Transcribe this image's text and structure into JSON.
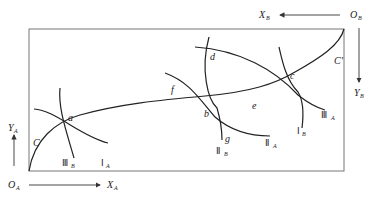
{
  "diagram": {
    "origins": {
      "A": "O_A",
      "B": "O_B"
    },
    "axes": {
      "XA": "X_A",
      "YA": "Y_A",
      "XB": "X_B",
      "YB": "Y_B"
    },
    "labels": {
      "O": "O",
      "A": "A",
      "B": "B",
      "X": "X",
      "Y": "Y",
      "C": "C",
      "Cprime": "C'",
      "a": "a",
      "b": "b",
      "c": "c",
      "d": "d",
      "e": "e",
      "f": "f",
      "g": "g"
    },
    "curves": {
      "IA": {
        "roman": "Ⅰ",
        "sub": "A"
      },
      "IIA": {
        "roman": "Ⅱ",
        "sub": "A"
      },
      "IIIA": {
        "roman": "Ⅲ",
        "sub": "A"
      },
      "IB": {
        "roman": "Ⅰ",
        "sub": "B"
      },
      "IIB": {
        "roman": "Ⅱ",
        "sub": "B"
      },
      "IIIB": {
        "roman": "Ⅲ",
        "sub": "B"
      }
    },
    "colors": {
      "line": "#222222",
      "box": "#777777",
      "background": "#ffffff"
    }
  }
}
